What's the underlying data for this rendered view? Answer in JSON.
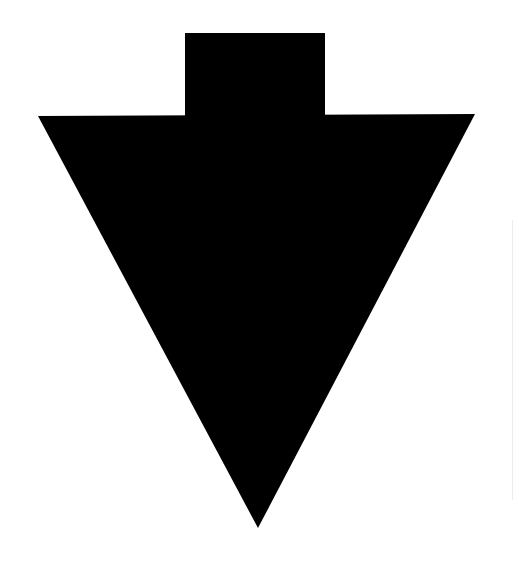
{
  "figure": {
    "icon": "arrow-down-icon",
    "colors": {
      "shape": "#000000",
      "background": "#ffffff",
      "edge_line": "#ececec"
    },
    "shape": {
      "stem": {
        "x": 185,
        "y": 33,
        "width": 140,
        "height": 84
      },
      "head": {
        "left": [
          38,
          116
        ],
        "right": [
          475,
          114
        ],
        "tip": [
          258,
          528
        ]
      }
    }
  }
}
